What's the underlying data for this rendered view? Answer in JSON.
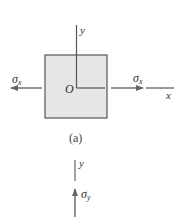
{
  "figure_a": {
    "caption": "(a)",
    "origin_label": "O",
    "y_axis_label": "y",
    "x_axis_label": "x",
    "left_stress_label": "σ",
    "left_stress_sub": "x",
    "right_stress_label": "σ",
    "right_stress_sub": "x",
    "element_fill": "#e6e6e6",
    "stroke_color": "#555555"
  },
  "figure_b": {
    "y_axis_label": "y",
    "stress_label": "σ",
    "stress_sub": "y"
  }
}
